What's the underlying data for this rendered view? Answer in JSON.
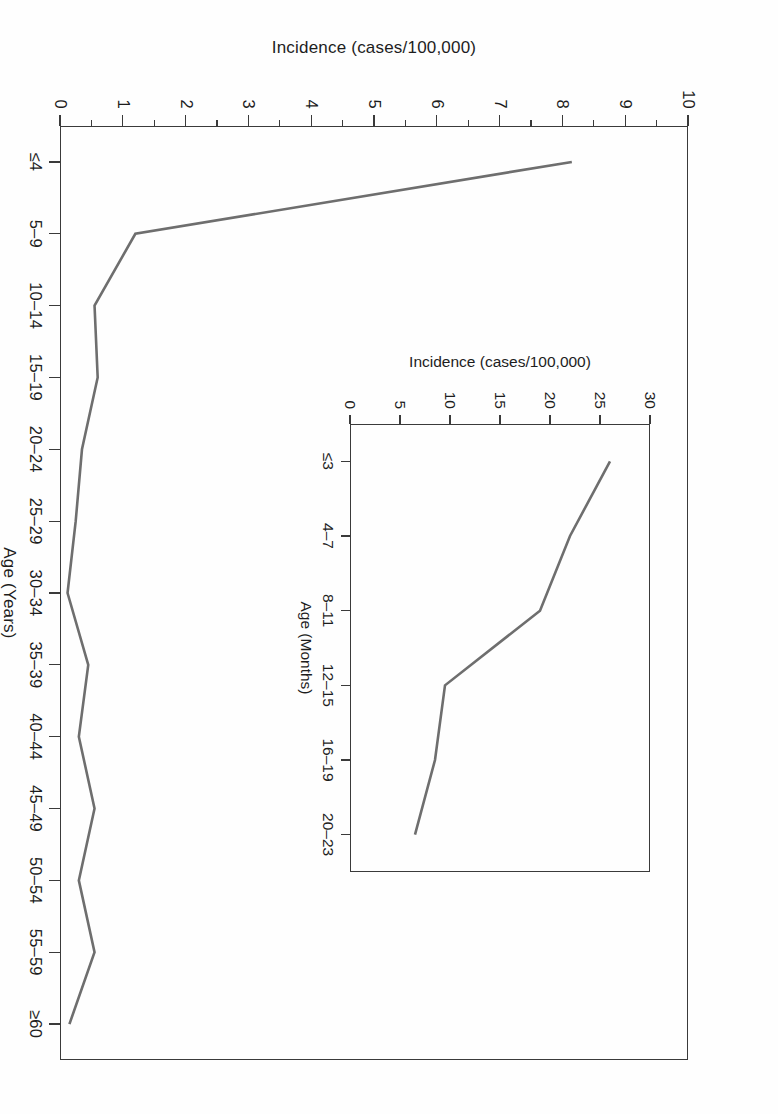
{
  "figure": {
    "orientation_degrees": 90,
    "background_color": "#fefefe",
    "line_color": "#6e6e6e",
    "axis_color": "#3a3a3a"
  },
  "main": {
    "ylabel": "Incidence (cases/100,000)",
    "xlabel": "Age (Years)",
    "y_ticks": [
      "0",
      "1",
      "2",
      "3",
      "4",
      "5",
      "6",
      "7",
      "8",
      "9",
      "10"
    ],
    "x_ticks": [
      "≤4",
      "5–9",
      "10–14",
      "15–19",
      "20–24",
      "25–29",
      "30–34",
      "35–39",
      "40–44",
      "45–49",
      "50–54",
      "55–59",
      "≥60"
    ]
  },
  "inset": {
    "ylabel": "Incidence (cases/100,000)",
    "xlabel": "Age (Months)",
    "y_ticks": [
      "0",
      "5",
      "10",
      "15",
      "20",
      "25",
      "30"
    ],
    "x_ticks": [
      "≤3",
      "4–7",
      "8–11",
      "12–15",
      "16–19",
      "20–23"
    ]
  },
  "chart_data": [
    {
      "type": "line",
      "name": "main",
      "title": "",
      "xlabel": "Age (Years)",
      "ylabel": "Incidence (cases/100,000)",
      "categories": [
        "≤4",
        "5–9",
        "10–14",
        "15–19",
        "20–24",
        "25–29",
        "30–34",
        "35–39",
        "40–44",
        "45–49",
        "50–54",
        "55–59",
        "≥60"
      ],
      "values": [
        8.15,
        1.2,
        0.55,
        0.6,
        0.35,
        0.25,
        0.12,
        0.45,
        0.3,
        0.55,
        0.3,
        0.55,
        0.15
      ],
      "ylim": [
        0,
        10
      ],
      "y_tick_values": [
        0,
        1,
        2,
        3,
        4,
        5,
        6,
        7,
        8,
        9,
        10
      ],
      "grid": false,
      "legend": false
    },
    {
      "type": "line",
      "name": "inset",
      "title": "",
      "xlabel": "Age (Months)",
      "ylabel": "Incidence (cases/100,000)",
      "categories": [
        "≤3",
        "4–7",
        "8–11",
        "12–15",
        "16–19",
        "20–23"
      ],
      "values": [
        26.0,
        22.0,
        19.0,
        9.5,
        8.5,
        6.5
      ],
      "ylim": [
        0,
        30
      ],
      "y_tick_values": [
        0,
        5,
        10,
        15,
        20,
        25,
        30
      ],
      "grid": false,
      "legend": false
    }
  ]
}
